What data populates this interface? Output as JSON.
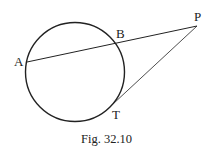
{
  "figure": {
    "caption": "Fig. 32.10",
    "points": {
      "A": {
        "label": "A"
      },
      "B": {
        "label": "B"
      },
      "P": {
        "label": "P"
      },
      "T": {
        "label": "T"
      }
    },
    "elements": [
      {
        "type": "circle"
      },
      {
        "type": "secant",
        "from": "P",
        "through": "B",
        "to": "A"
      },
      {
        "type": "tangent",
        "from": "P",
        "to": "T"
      }
    ],
    "colors": {
      "stroke": "#222222",
      "background": "#ffffff"
    }
  }
}
